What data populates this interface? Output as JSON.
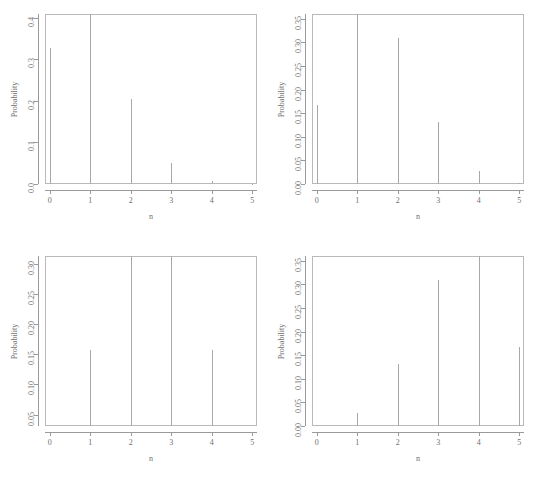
{
  "figure": {
    "layout": "2x2 grid of probability mass function plots",
    "background_color": "#ffffff",
    "needle_color": "#a8a8a8",
    "axis_color": "#9a9a9a",
    "text_color": "#6f6f6f"
  },
  "chart_data": [
    {
      "type": "bar",
      "panel": "top-left",
      "title": "",
      "xlabel": "n",
      "ylabel": "Probability",
      "x": [
        0,
        1,
        2,
        3,
        4,
        5
      ],
      "categories": [
        "0",
        "1",
        "2",
        "3",
        "4",
        "5"
      ],
      "values": [
        0.3277,
        0.4096,
        0.2048,
        0.0512,
        0.0064,
        0.0003
      ],
      "xlim": [
        -0.12,
        5.12
      ],
      "ylim": [
        0.0,
        0.4096
      ],
      "xticks": [
        0,
        1,
        2,
        3,
        4,
        5
      ],
      "xtick_labels": [
        "0",
        "1",
        "2",
        "3",
        "4",
        "5"
      ],
      "yticks": [
        0.0,
        0.1,
        0.2,
        0.3,
        0.4
      ],
      "ytick_labels": [
        "0.0",
        "0.1",
        "0.2",
        "0.3",
        "0.4"
      ],
      "grid": false,
      "legend": "none"
    },
    {
      "type": "bar",
      "panel": "top-right",
      "title": "",
      "xlabel": "n",
      "ylabel": "Probability",
      "x": [
        0,
        1,
        2,
        3,
        4,
        5
      ],
      "categories": [
        "0",
        "1",
        "2",
        "3",
        "4",
        "5"
      ],
      "values": [
        0.1681,
        0.3602,
        0.3087,
        0.1323,
        0.0284,
        0.0024
      ],
      "xlim": [
        -0.12,
        5.12
      ],
      "ylim": [
        0.0,
        0.3602
      ],
      "xticks": [
        0,
        1,
        2,
        3,
        4,
        5
      ],
      "xtick_labels": [
        "0",
        "1",
        "2",
        "3",
        "4",
        "5"
      ],
      "yticks": [
        0.0,
        0.05,
        0.1,
        0.15,
        0.2,
        0.25,
        0.3,
        0.35
      ],
      "ytick_labels": [
        "0.00",
        "0.05",
        "0.10",
        "0.15",
        "0.20",
        "0.25",
        "0.30",
        "0.35"
      ],
      "grid": false,
      "legend": "none"
    },
    {
      "type": "bar",
      "panel": "bottom-left",
      "title": "",
      "xlabel": "n",
      "ylabel": "Probability",
      "x": [
        0,
        1,
        2,
        3,
        4,
        5
      ],
      "categories": [
        "0",
        "1",
        "2",
        "3",
        "4",
        "5"
      ],
      "values": [
        0.03125,
        0.15625,
        0.3125,
        0.3125,
        0.15625,
        0.03125
      ],
      "xlim": [
        -0.12,
        5.12
      ],
      "ylim": [
        0.03125,
        0.3125
      ],
      "xticks": [
        0,
        1,
        2,
        3,
        4,
        5
      ],
      "xtick_labels": [
        "0",
        "1",
        "2",
        "3",
        "4",
        "5"
      ],
      "yticks": [
        0.05,
        0.1,
        0.15,
        0.2,
        0.25,
        0.3
      ],
      "ytick_labels": [
        "0.05",
        "0.10",
        "0.15",
        "0.20",
        "0.25",
        "0.30"
      ],
      "grid": false,
      "legend": "none"
    },
    {
      "type": "bar",
      "panel": "bottom-right",
      "title": "",
      "xlabel": "n",
      "ylabel": "Probability",
      "x": [
        0,
        1,
        2,
        3,
        4,
        5
      ],
      "categories": [
        "0",
        "1",
        "2",
        "3",
        "4",
        "5"
      ],
      "values": [
        0.0024,
        0.0284,
        0.1323,
        0.3087,
        0.3602,
        0.1681
      ],
      "xlim": [
        -0.12,
        5.12
      ],
      "ylim": [
        0.0,
        0.3602
      ],
      "xticks": [
        0,
        1,
        2,
        3,
        4,
        5
      ],
      "xtick_labels": [
        "0",
        "1",
        "2",
        "3",
        "4",
        "5"
      ],
      "yticks": [
        0.0,
        0.05,
        0.1,
        0.15,
        0.2,
        0.25,
        0.3,
        0.35
      ],
      "ytick_labels": [
        "0.00",
        "0.05",
        "0.10",
        "0.15",
        "0.20",
        "0.25",
        "0.30",
        "0.35"
      ],
      "grid": false,
      "legend": "none"
    }
  ]
}
